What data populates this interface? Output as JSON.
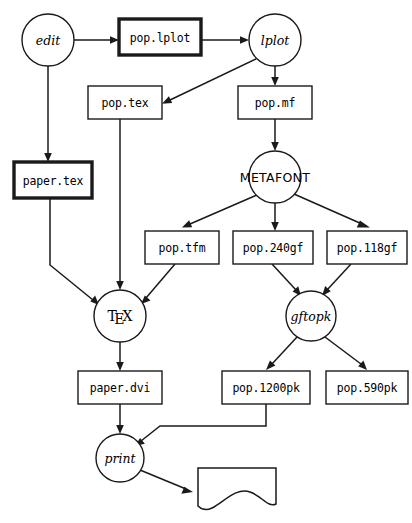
{
  "diagram": {
    "background_color": "#ffffff",
    "line_color": "#1a1a1a",
    "nodes": [
      {
        "id": "edit",
        "label": "edit",
        "shape": "circle",
        "style": "italic",
        "cx": 48,
        "cy": 40,
        "r": 26
      },
      {
        "id": "pop_lplot",
        "label": "pop.lplot",
        "shape": "box-bold",
        "style": "mono",
        "x": 119,
        "y": 19,
        "w": 82,
        "h": 36
      },
      {
        "id": "lplot",
        "label": "lplot",
        "shape": "circle",
        "style": "italic",
        "cx": 275,
        "cy": 40,
        "r": 26
      },
      {
        "id": "pop_tex",
        "label": "pop.tex",
        "shape": "box",
        "style": "mono",
        "x": 88,
        "y": 86,
        "w": 74,
        "h": 33
      },
      {
        "id": "pop_mf",
        "label": "pop.mf",
        "shape": "box",
        "style": "mono",
        "x": 238,
        "y": 86,
        "w": 74,
        "h": 33
      },
      {
        "id": "paper_tex",
        "label": "paper.tex",
        "shape": "box-bold",
        "style": "mono",
        "x": 14,
        "y": 162,
        "w": 78,
        "h": 36
      },
      {
        "id": "metafont",
        "label": "METAFONT",
        "shape": "circle",
        "style": "metafont",
        "cx": 275,
        "cy": 177,
        "r": 26
      },
      {
        "id": "pop_tfm",
        "label": "pop.tfm",
        "shape": "box",
        "style": "mono",
        "x": 145,
        "y": 231,
        "w": 74,
        "h": 33
      },
      {
        "id": "pop_240gf",
        "label": "pop.240gf",
        "shape": "box",
        "style": "mono",
        "x": 233,
        "y": 231,
        "w": 80,
        "h": 33
      },
      {
        "id": "pop_118gf",
        "label": "pop.118gf",
        "shape": "box",
        "style": "mono",
        "x": 327,
        "y": 231,
        "w": 80,
        "h": 33
      },
      {
        "id": "tex",
        "label": "TeX",
        "shape": "circle",
        "style": "tex",
        "cx": 120,
        "cy": 316,
        "r": 26
      },
      {
        "id": "gftopk",
        "label": "gftopk",
        "shape": "circle",
        "style": "italic",
        "cx": 311,
        "cy": 316,
        "r": 25
      },
      {
        "id": "paper_dvi",
        "label": "paper.dvi",
        "shape": "box",
        "style": "mono",
        "x": 78,
        "y": 371,
        "w": 84,
        "h": 33
      },
      {
        "id": "pop_1200pk",
        "label": "pop.1200pk",
        "shape": "box",
        "style": "mono",
        "x": 222,
        "y": 371,
        "w": 88,
        "h": 33
      },
      {
        "id": "pop_590pk",
        "label": "pop.590pk",
        "shape": "box",
        "style": "mono",
        "x": 326,
        "y": 371,
        "w": 82,
        "h": 33
      },
      {
        "id": "print",
        "label": "print",
        "shape": "circle",
        "style": "italic",
        "cx": 120,
        "cy": 458,
        "r": 24
      },
      {
        "id": "printout",
        "label": "",
        "shape": "document",
        "style": "none",
        "x": 198,
        "y": 468,
        "w": 78,
        "h": 48
      }
    ],
    "edges": [
      {
        "from": "edit",
        "to": "pop_lplot"
      },
      {
        "from": "edit",
        "to": "paper_tex"
      },
      {
        "from": "pop_lplot",
        "to": "lplot"
      },
      {
        "from": "lplot",
        "to": "pop_tex"
      },
      {
        "from": "lplot",
        "to": "pop_mf"
      },
      {
        "from": "pop_mf",
        "to": "metafont"
      },
      {
        "from": "metafont",
        "to": "pop_tfm"
      },
      {
        "from": "metafont",
        "to": "pop_240gf"
      },
      {
        "from": "metafont",
        "to": "pop_118gf"
      },
      {
        "from": "pop_tex",
        "to": "tex"
      },
      {
        "from": "paper_tex",
        "to": "tex"
      },
      {
        "from": "pop_tfm",
        "to": "tex"
      },
      {
        "from": "pop_240gf",
        "to": "gftopk"
      },
      {
        "from": "pop_118gf",
        "to": "gftopk"
      },
      {
        "from": "gftopk",
        "to": "pop_1200pk"
      },
      {
        "from": "gftopk",
        "to": "pop_590pk"
      },
      {
        "from": "tex",
        "to": "paper_dvi"
      },
      {
        "from": "paper_dvi",
        "to": "print"
      },
      {
        "from": "pop_1200pk",
        "to": "print"
      },
      {
        "from": "print",
        "to": "printout"
      }
    ]
  }
}
